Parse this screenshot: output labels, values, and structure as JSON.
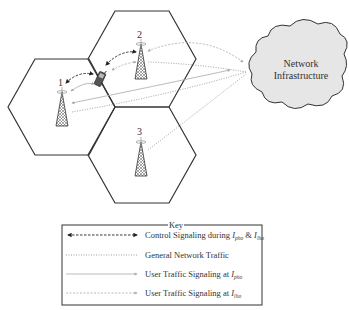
{
  "diagram": {
    "cells": [
      {
        "id": "cell-1",
        "tower_label": "1"
      },
      {
        "id": "cell-2",
        "tower_label": "2"
      },
      {
        "id": "cell-3",
        "tower_label": "3"
      }
    ],
    "cloud": {
      "line1": "Network",
      "line2": "Infrastructure",
      "fill": "#e6e6e6"
    },
    "colors": {
      "stroke": "#333333",
      "signaling": "#222222",
      "traffic": "#999999",
      "user_traffic": "#aaaaaa"
    }
  },
  "key": {
    "title": "Key",
    "items": [
      {
        "style": "dashed-double-arrow",
        "label": "Control Signaling during ",
        "sym1": "I",
        "sub1": "pho",
        "mid": " & ",
        "sym2": "I",
        "sub2": "lho"
      },
      {
        "style": "dotted",
        "label": "General Network Traffic"
      },
      {
        "style": "solid-arrow",
        "label": "User Traffic Signaling at ",
        "sym1": "I",
        "sub1": "pho"
      },
      {
        "style": "dotted-arrow",
        "label": "User Traffic Signaling at ",
        "sym1": "I",
        "sub1": "lho"
      }
    ]
  }
}
